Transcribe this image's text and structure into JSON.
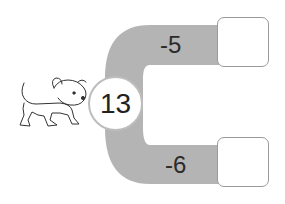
{
  "puzzle": {
    "start_value": "13",
    "branches": [
      {
        "operation": "-5",
        "answer": ""
      },
      {
        "operation": "-6",
        "answer": ""
      }
    ]
  },
  "colors": {
    "track": "#b4b4b4",
    "box_border": "#9a9a9a"
  },
  "illustration": "dog"
}
